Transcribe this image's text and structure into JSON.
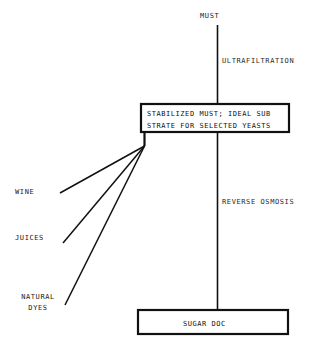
{
  "diagram": {
    "title": "MUST",
    "type": "process-flow",
    "input_node": {
      "label": "MUST"
    },
    "processes": [
      {
        "name": "ultrafiltration",
        "label": "ULTRAFILTRATION"
      },
      {
        "name": "reverse-osmosis",
        "label": "REVERSE OSMOSIS"
      }
    ],
    "boxes": [
      {
        "name": "stabilized-must-box",
        "lines": [
          "STABILIZED MUST; IDEAL SUB",
          "STRATE FOR SELECTED YEASTS"
        ],
        "text": "STABILIZED MUST; IDEAL SUB\nSTRATE FOR SELECTED YEASTS"
      },
      {
        "name": "sugar-doc-box",
        "lines": [
          "SUGAR DOC"
        ],
        "text": "SUGAR DOC"
      }
    ],
    "feed_inputs": [
      {
        "name": "wine",
        "label": "WINE"
      },
      {
        "name": "juices",
        "label": "JUICES"
      },
      {
        "name": "natural-dyes",
        "label": "NATURAL\nDYES"
      }
    ],
    "colors": {
      "line": "#111111",
      "text": "#191919",
      "background": "#ffffff"
    }
  }
}
